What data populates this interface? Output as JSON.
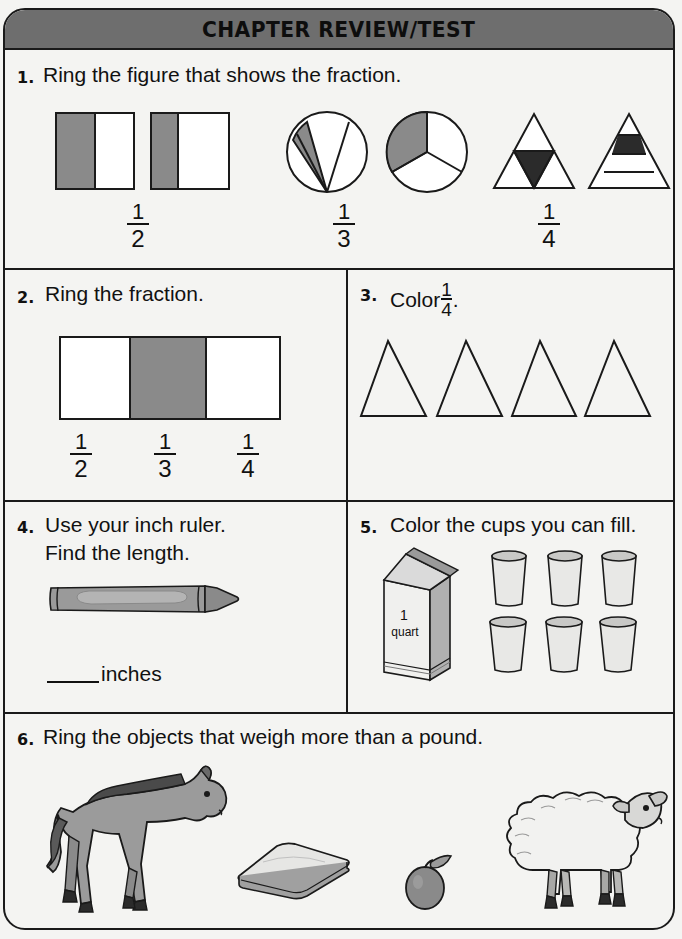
{
  "header": {
    "title": "CHAPTER REVIEW/TEST"
  },
  "colors": {
    "banner": "#6e6e6e",
    "ink": "#1a1a1a",
    "paper": "#f4f4f2",
    "shade": "#8a8a8a",
    "dark_shade": "#2b2b2b"
  },
  "problems": [
    {
      "number": "1.",
      "text": "Ring the figure that shows the fraction.",
      "groups": [
        {
          "label_num": "1",
          "label_den": "2",
          "figures": [
            "square-half-shaded",
            "square-third-shaded"
          ]
        },
        {
          "label_num": "1",
          "label_den": "3",
          "figures": [
            "circle-unequal-thirds",
            "circle-equal-thirds"
          ]
        },
        {
          "label_num": "1",
          "label_den": "4",
          "figures": [
            "triangle-four-parts",
            "triangle-bands"
          ]
        }
      ]
    },
    {
      "number": "2.",
      "text": "Ring the fraction.",
      "figure": "bar-thirds-middle-shaded",
      "choices": [
        {
          "num": "1",
          "den": "2"
        },
        {
          "num": "1",
          "den": "3"
        },
        {
          "num": "1",
          "den": "4"
        }
      ]
    },
    {
      "number": "3.",
      "text_before": "Color",
      "fraction": {
        "num": "1",
        "den": "4"
      },
      "text_after": ".",
      "shapes": [
        "triangle",
        "triangle",
        "triangle",
        "triangle"
      ],
      "shape_count": 4
    },
    {
      "number": "4.",
      "text_line1": "Use your inch ruler.",
      "text_line2": "Find the length.",
      "figure": "crayon",
      "answer_unit": "inches"
    },
    {
      "number": "5.",
      "text": "Color the cups you can fill.",
      "carton_label_line1": "1",
      "carton_label_line2": "quart",
      "cups": 6
    },
    {
      "number": "6.",
      "text": "Ring the objects that weigh more than a pound.",
      "objects": [
        "horse",
        "book",
        "plum",
        "sheep"
      ]
    }
  ]
}
